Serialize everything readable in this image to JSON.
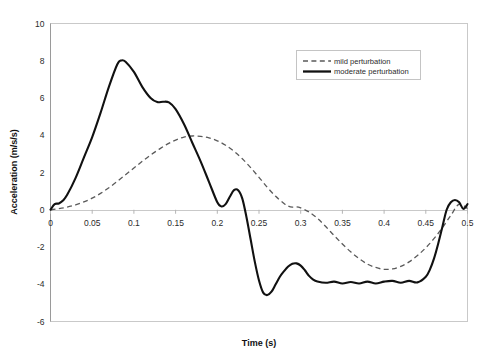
{
  "chart_data": {
    "type": "line",
    "title": "",
    "xlabel": "Time (s)",
    "ylabel": "Acceleration (m/s/s)",
    "xlim": [
      0,
      0.5
    ],
    "ylim": [
      -6,
      10
    ],
    "xticks": [
      "0",
      "0.05",
      "0.1",
      "0.15",
      "0.2",
      "0.25",
      "0.3",
      "0.35",
      "0.4",
      "0.45",
      "0.5"
    ],
    "xtick_values": [
      0,
      0.05,
      0.1,
      0.15,
      0.2,
      0.25,
      0.3,
      0.35,
      0.4,
      0.45,
      0.5
    ],
    "yticks": [
      "-6",
      "-4",
      "-2",
      "0",
      "2",
      "4",
      "6",
      "8",
      "10"
    ],
    "ytick_values": [
      -6,
      -4,
      -2,
      0,
      2,
      4,
      6,
      8,
      10
    ],
    "grid": false,
    "legend_position": "top-right",
    "series": [
      {
        "name": "mild perturbation",
        "style": "dashed",
        "color": "#5a5a5a",
        "x": [
          0.0,
          0.01,
          0.02,
          0.03,
          0.04,
          0.05,
          0.06,
          0.07,
          0.08,
          0.09,
          0.1,
          0.11,
          0.12,
          0.13,
          0.14,
          0.15,
          0.16,
          0.17,
          0.18,
          0.19,
          0.2,
          0.21,
          0.22,
          0.23,
          0.24,
          0.25,
          0.26,
          0.27,
          0.28,
          0.285,
          0.29,
          0.295,
          0.3,
          0.31,
          0.32,
          0.33,
          0.34,
          0.35,
          0.36,
          0.37,
          0.38,
          0.39,
          0.4,
          0.41,
          0.42,
          0.43,
          0.44,
          0.45,
          0.46,
          0.47,
          0.48,
          0.49,
          0.5
        ],
        "y": [
          0.0,
          0.06,
          0.14,
          0.26,
          0.42,
          0.62,
          0.88,
          1.18,
          1.52,
          1.88,
          2.24,
          2.6,
          2.94,
          3.24,
          3.52,
          3.74,
          3.9,
          3.96,
          3.94,
          3.86,
          3.7,
          3.46,
          3.14,
          2.74,
          2.26,
          1.74,
          1.2,
          0.72,
          0.34,
          0.2,
          0.14,
          0.16,
          0.1,
          -0.12,
          -0.46,
          -0.9,
          -1.38,
          -1.84,
          -2.26,
          -2.62,
          -2.92,
          -3.1,
          -3.2,
          -3.18,
          -3.04,
          -2.8,
          -2.46,
          -2.04,
          -1.54,
          -0.96,
          -0.3,
          0.3,
          0.06
        ]
      },
      {
        "name": "moderate perturbation",
        "style": "solid",
        "color": "#111111",
        "x": [
          0.0,
          0.005,
          0.01,
          0.015,
          0.02,
          0.03,
          0.04,
          0.05,
          0.06,
          0.07,
          0.08,
          0.085,
          0.09,
          0.1,
          0.11,
          0.12,
          0.128,
          0.135,
          0.142,
          0.15,
          0.16,
          0.17,
          0.18,
          0.19,
          0.2,
          0.205,
          0.21,
          0.215,
          0.22,
          0.225,
          0.23,
          0.235,
          0.24,
          0.245,
          0.25,
          0.255,
          0.26,
          0.265,
          0.27,
          0.275,
          0.28,
          0.285,
          0.29,
          0.295,
          0.3,
          0.305,
          0.31,
          0.315,
          0.32,
          0.33,
          0.34,
          0.35,
          0.36,
          0.37,
          0.38,
          0.39,
          0.4,
          0.41,
          0.42,
          0.43,
          0.44,
          0.45,
          0.455,
          0.46,
          0.465,
          0.47,
          0.475,
          0.48,
          0.485,
          0.49,
          0.495,
          0.5
        ],
        "y": [
          0.0,
          0.3,
          0.34,
          0.5,
          0.8,
          1.7,
          2.8,
          3.9,
          5.2,
          6.6,
          7.8,
          8.02,
          7.95,
          7.4,
          6.6,
          6.0,
          5.78,
          5.8,
          5.76,
          5.4,
          4.6,
          3.6,
          2.6,
          1.5,
          0.4,
          0.18,
          0.3,
          0.7,
          1.05,
          1.05,
          0.6,
          -0.4,
          -1.6,
          -2.8,
          -3.8,
          -4.45,
          -4.58,
          -4.4,
          -4.0,
          -3.6,
          -3.3,
          -3.05,
          -2.9,
          -2.88,
          -3.0,
          -3.25,
          -3.55,
          -3.75,
          -3.85,
          -3.92,
          -3.86,
          -3.96,
          -3.88,
          -3.96,
          -3.86,
          -3.96,
          -3.86,
          -3.82,
          -3.92,
          -3.82,
          -3.9,
          -3.6,
          -3.2,
          -2.6,
          -1.8,
          -0.9,
          0.0,
          0.4,
          0.52,
          0.4,
          0.05,
          0.3
        ]
      }
    ],
    "legend": [
      {
        "label": "mild perturbation",
        "style": "dashed"
      },
      {
        "label": "moderate perturbation",
        "style": "solid"
      }
    ]
  },
  "axes": {
    "x_title": "Time (s)",
    "y_title": "Acceleration (m/s/s)"
  }
}
